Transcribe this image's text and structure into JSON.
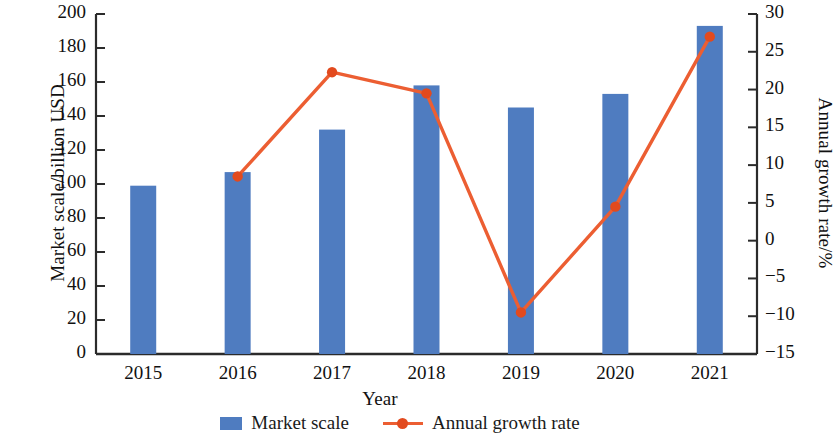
{
  "chart_data": {
    "type": "bar",
    "title": "",
    "subtitle": "",
    "xlabel": "Year",
    "ylabel": "Market scale/billion USD",
    "y2label": "Annual growth rate/%",
    "categories": [
      "2015",
      "2016",
      "2017",
      "2018",
      "2019",
      "2020",
      "2021"
    ],
    "ylim": [
      0,
      200
    ],
    "y2lim": [
      -15,
      30
    ],
    "yticks": [
      "0",
      "20",
      "40",
      "60",
      "80",
      "100",
      "120",
      "140",
      "160",
      "180",
      "200"
    ],
    "y2ticks": [
      "−15",
      "−10",
      "−5",
      "0",
      "5",
      "10",
      "15",
      "20",
      "25",
      "30"
    ],
    "grid": false,
    "legend_position": "bottom-center",
    "series": [
      {
        "name": "Market scale",
        "type": "bar",
        "axis": "left",
        "color": "#4f7cc0",
        "unit": "billion USD",
        "values": [
          99,
          107,
          132,
          158,
          145,
          153,
          193
        ]
      },
      {
        "name": "Annual growth rate",
        "type": "line",
        "axis": "right",
        "color": "#ec5e32",
        "marker_color": "#e24a1e",
        "unit": "%",
        "values": [
          null,
          8.5,
          22.3,
          19.5,
          -9.5,
          4.5,
          27.0
        ]
      }
    ]
  },
  "axes": {
    "left_title": "Market scale/billion USD",
    "right_title": "Annual growth rate/%",
    "x_title": "Year"
  },
  "legend": {
    "items": [
      {
        "label": "Market scale",
        "marker": "bar-swatch-icon"
      },
      {
        "label": "Annual growth rate",
        "marker": "line-marker-icon"
      }
    ]
  },
  "tick_values": {
    "left": [
      "200",
      "180",
      "160",
      "140",
      "120",
      "100",
      "80",
      "60",
      "40",
      "20",
      "0"
    ],
    "right": [
      "30",
      "25",
      "20",
      "15",
      "10",
      "5",
      "0",
      "−5",
      "−10",
      "−15"
    ],
    "x": [
      "2015",
      "2016",
      "2017",
      "2018",
      "2019",
      "2020",
      "2021"
    ]
  }
}
